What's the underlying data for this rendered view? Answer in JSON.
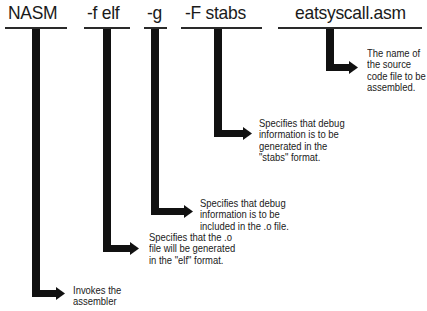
{
  "diagram": {
    "parts": [
      {
        "term": "NASM",
        "description_lines": [
          "Invokes the",
          "assembler"
        ]
      },
      {
        "term": "-f elf",
        "description_lines": [
          "Specifies that the .o",
          "file will be generated",
          "in the \"elf\" format."
        ]
      },
      {
        "term": "-g",
        "description_lines": [
          "Specifies that debug",
          "information is to be",
          "included in the .o file."
        ]
      },
      {
        "term": "-F stabs",
        "description_lines": [
          "Specifies that debug",
          "information is to be",
          "generated in the",
          "\"stabs\" format."
        ]
      },
      {
        "term": "eatsyscall.asm",
        "description_lines": [
          "The name of",
          "the source",
          "code file to be",
          "assembled."
        ]
      }
    ],
    "colors": {
      "line": "#111111",
      "rule": "#2a2a2a",
      "text": "#1a1a1a",
      "background": "#ffffff"
    }
  }
}
